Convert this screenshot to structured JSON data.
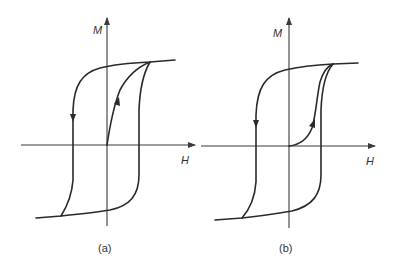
{
  "figure": {
    "panels": [
      {
        "id": "a",
        "caption": "(a)",
        "x_axis_label": "H",
        "y_axis_label": "M",
        "description": "Hysteresis loop with initial magnetization curve rising steeply (nearly linearly) from origin to saturation"
      },
      {
        "id": "b",
        "caption": "(b)",
        "x_axis_label": "H",
        "y_axis_label": "M",
        "description": "Hysteresis loop with initial magnetization curve starting flat at origin then rising sharply near coercive field to saturation"
      }
    ],
    "colors": {
      "line": "#2a2a2a",
      "axis": "#3a3a3a",
      "background": "#ffffff"
    }
  }
}
